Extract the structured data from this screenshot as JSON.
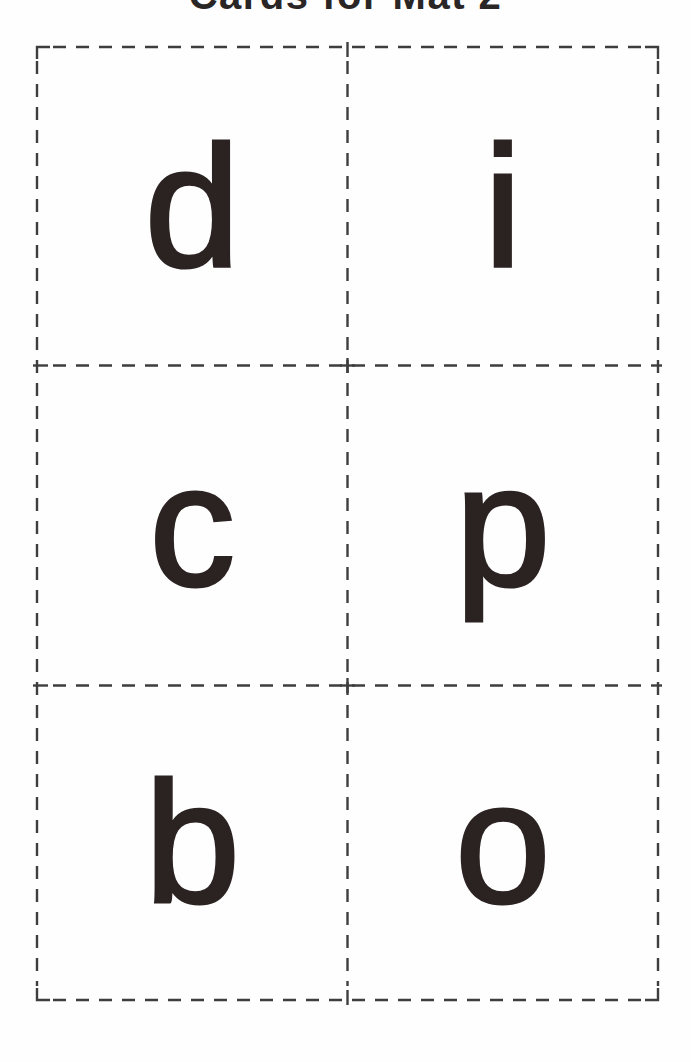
{
  "page": {
    "title": "Cards for Mat 2",
    "title_note": "title clipped by top edge of scan; only bottom of letters visible"
  },
  "cards": [
    {
      "letter": "d"
    },
    {
      "letter": "i"
    },
    {
      "letter": "c"
    },
    {
      "letter": "p"
    },
    {
      "letter": "b"
    },
    {
      "letter": "o"
    }
  ],
  "colors": {
    "background": "#fefefe",
    "letter_color": "#2b2222",
    "cut_line_color": "#3e3e3e",
    "title_color": "#2b2626"
  }
}
